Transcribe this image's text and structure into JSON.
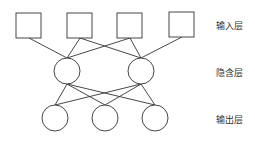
{
  "labels": {
    "input_layer": "输入层",
    "hidden_layer": "隐含层",
    "output_layer": "输出层"
  },
  "nodes": {
    "input": [
      {
        "x": 16,
        "y": 13,
        "size": 25
      },
      {
        "x": 67,
        "y": 13,
        "size": 25
      },
      {
        "x": 117,
        "y": 13,
        "size": 25
      },
      {
        "x": 169,
        "y": 12,
        "size": 25
      }
    ],
    "hidden": [
      {
        "cx": 67,
        "cy": 71,
        "r": 13
      },
      {
        "cx": 141,
        "cy": 71,
        "r": 13
      }
    ],
    "output": [
      {
        "cx": 55,
        "cy": 118,
        "r": 13
      },
      {
        "cx": 105,
        "cy": 118,
        "r": 13
      },
      {
        "cx": 155,
        "cy": 118,
        "r": 13
      }
    ]
  },
  "colors": {
    "stroke": "#333333",
    "text": "#333333"
  }
}
